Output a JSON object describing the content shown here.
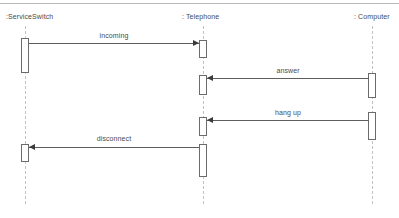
{
  "diagram": {
    "kind": "uml-sequence-diagram",
    "canvas": {
      "width": 399,
      "height": 218,
      "background": "#ffffff"
    },
    "top_rule": {
      "y": 3,
      "color": "#b9b9b9"
    },
    "lifelines": [
      {
        "id": "serviceswitch",
        "label": ":ServiceSwitch",
        "label_x": 6,
        "label_y": 12,
        "axis_x": 25,
        "stem_top": 26,
        "stem_bottom": 204,
        "activations": [
          {
            "top": 38,
            "height": 35
          },
          {
            "top": 144,
            "height": 18
          }
        ]
      },
      {
        "id": "telephone",
        "label": ": Telephone",
        "label_x": 182,
        "label_y": 12,
        "axis_x": 203,
        "stem_top": 26,
        "stem_bottom": 204,
        "activations": [
          {
            "top": 40,
            "height": 18
          },
          {
            "top": 75,
            "height": 20
          },
          {
            "top": 117,
            "height": 19
          },
          {
            "top": 144,
            "height": 33
          }
        ]
      },
      {
        "id": "computer",
        "label": ": Computer",
        "label_x": 354,
        "label_y": 12,
        "axis_x": 372,
        "stem_top": 26,
        "stem_bottom": 204,
        "activations": [
          {
            "top": 73,
            "height": 25
          },
          {
            "top": 112,
            "height": 28
          }
        ]
      }
    ],
    "messages": [
      {
        "id": "incoming",
        "label": "incoming",
        "from": "serviceswitch",
        "to": "telephone",
        "direction": "right",
        "y": 43,
        "x_start": 29,
        "x_end": 199,
        "label_x": 84,
        "label_y": 31,
        "label_width": 60
      },
      {
        "id": "answer",
        "label": "answer",
        "from": "computer",
        "to": "telephone",
        "direction": "left",
        "y": 78,
        "x_start": 207,
        "x_end": 369,
        "label_x": 258,
        "label_y": 66,
        "label_width": 60
      },
      {
        "id": "hang-up",
        "label": "hang up",
        "from": "computer",
        "to": "telephone",
        "direction": "left",
        "y": 120,
        "x_start": 207,
        "x_end": 369,
        "label_x": 258,
        "label_y": 108,
        "label_width": 60
      },
      {
        "id": "disconnect",
        "label": "disconnect",
        "from": "telephone",
        "to": "serviceswitch",
        "direction": "left",
        "y": 147,
        "x_start": 29,
        "x_end": 199,
        "label_x": 82,
        "label_y": 134,
        "label_width": 64
      }
    ],
    "colors": {
      "stroke": "#5e2b2b",
      "lifeline_dash": "#c2c2c2",
      "activation_border": "#6b6b6b",
      "text": "#4a4a4a",
      "rule": "#b9b9b9"
    }
  }
}
